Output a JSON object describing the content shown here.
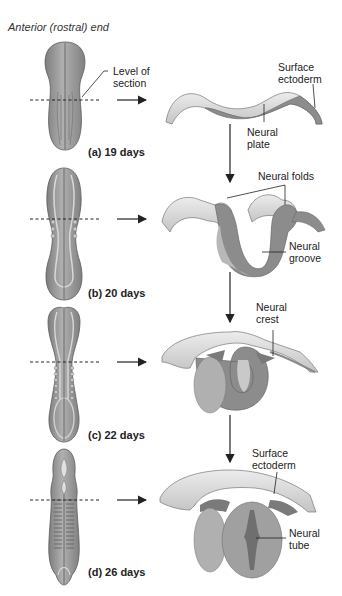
{
  "title": "Anterior (rostral) end",
  "stages": [
    {
      "id": "a",
      "label": "(a)  19 days",
      "days": 19
    },
    {
      "id": "b",
      "label": "(b)  20 days",
      "days": 20
    },
    {
      "id": "c",
      "label": "(c)  22 days",
      "days": 22
    },
    {
      "id": "d",
      "label": "(d)  26 days",
      "days": 26
    }
  ],
  "labels": {
    "level_of_section": [
      "Level of",
      "section"
    ],
    "surface_ectoderm_1": [
      "Surface",
      "ectoderm"
    ],
    "neural_plate": [
      "Neural",
      "plate"
    ],
    "neural_folds": [
      "Neural folds"
    ],
    "neural_groove": [
      "Neural",
      "groove"
    ],
    "neural_crest": [
      "Neural",
      "crest"
    ],
    "surface_ectoderm_2": [
      "Surface",
      "ectoderm"
    ],
    "neural_tube": [
      "Neural",
      "tube"
    ]
  },
  "colors": {
    "tissue_dark": "#8a8a8a",
    "tissue_mid": "#a8a8a8",
    "tissue_light": "#d4d4d4",
    "ectoderm_top": "#e2e2e2",
    "line": "#222222"
  }
}
